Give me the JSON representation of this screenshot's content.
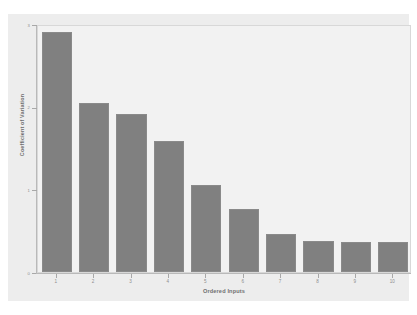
{
  "chart_data": {
    "type": "bar",
    "title": "",
    "xlabel": "Ordered Inputs",
    "ylabel": "Coefficient of Variation",
    "categories": [
      "1",
      "2",
      "3",
      "4",
      "5",
      "6",
      "7",
      "8",
      "9",
      "10"
    ],
    "values": [
      2.9,
      2.04,
      1.91,
      1.58,
      1.05,
      0.76,
      0.46,
      0.37,
      0.36,
      0.36
    ],
    "ylim": [
      0,
      3
    ],
    "yticks": [
      0,
      1,
      2,
      3
    ],
    "ytick_labels": [
      "0",
      "1",
      "2",
      "3"
    ],
    "xtick_labels": [
      "1",
      "2",
      "3",
      "4",
      "5",
      "6",
      "7",
      "8",
      "9",
      "10"
    ],
    "grid": false,
    "legend": null,
    "bar_color": "#808080",
    "plot_background": "#f2f2f2",
    "figure_background": "#ededed",
    "axis_color": "#b9b9b9",
    "tick_label_color": "#8d8d8d",
    "axis_title_color": "#6f6f6f"
  }
}
